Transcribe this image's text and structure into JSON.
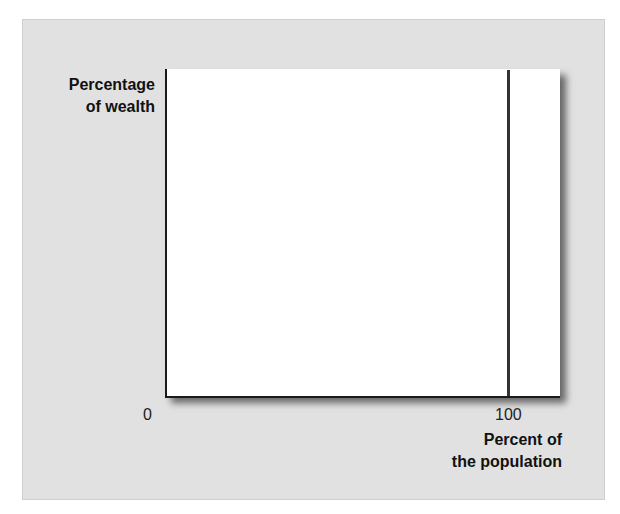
{
  "chart_data": {
    "type": "line",
    "title": "",
    "xlabel": "Percent of the population",
    "ylabel": "Percentage of wealth",
    "ylabel_lines": [
      "Percentage",
      "of wealth"
    ],
    "xlabel_lines": [
      "Percent of",
      "the population"
    ],
    "x_ticks": [
      "0",
      "100"
    ],
    "xlim": [
      0,
      100
    ],
    "ylim": [
      0,
      100
    ],
    "grid": false,
    "series": [
      {
        "name": "x = 100 boundary",
        "x": [
          100,
          100
        ],
        "y": [
          0,
          100
        ]
      }
    ],
    "colors": {
      "panel_background": "#e1e1e1",
      "plot_background": "#ffffff",
      "axis": "#1a1a1a"
    }
  }
}
